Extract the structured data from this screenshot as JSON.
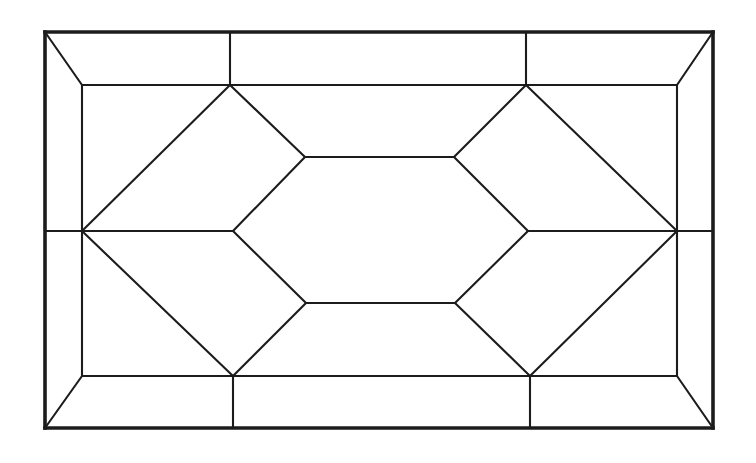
{
  "diagram": {
    "description": "nested-frame-line-drawing",
    "canvas": {
      "width": 756,
      "height": 463,
      "background_color": "#ffffff"
    },
    "style": {
      "line_color": "#1c1c1c",
      "outer_stroke_width": 3.6,
      "inner_stroke_width": 2.1
    },
    "vertices": {
      "outer_top_left": [
        45,
        32
      ],
      "outer_top_right": [
        713,
        32
      ],
      "outer_bottom_right": [
        713,
        428
      ],
      "outer_bottom_left": [
        45,
        428
      ],
      "outer_top_t1": [
        230,
        32
      ],
      "outer_top_t2": [
        526,
        32
      ],
      "outer_bottom_t1": [
        233,
        428
      ],
      "outer_bottom_t2": [
        530,
        428
      ],
      "outer_left_mid": [
        45,
        231
      ],
      "outer_right_mid": [
        713,
        231
      ],
      "inner_top_left": [
        82,
        85
      ],
      "inner_top_right": [
        677,
        85
      ],
      "inner_bottom_right": [
        677,
        376
      ],
      "inner_bottom_left": [
        82,
        376
      ],
      "inner_top_t1": [
        230,
        85
      ],
      "inner_top_t2": [
        526,
        85
      ],
      "inner_bottom_t1": [
        233,
        376
      ],
      "inner_bottom_t2": [
        530,
        376
      ],
      "inner_left_mid": [
        82,
        231
      ],
      "inner_right_mid": [
        677,
        231
      ],
      "hex_left": [
        233,
        231
      ],
      "hex_top_left": [
        305,
        157
      ],
      "hex_top_right": [
        454,
        157
      ],
      "hex_right": [
        528,
        231
      ],
      "hex_bottom_right": [
        455,
        303
      ],
      "hex_bottom_left": [
        306,
        303
      ]
    },
    "edges": {
      "outer": [
        [
          "outer_top_left",
          "outer_top_right"
        ],
        [
          "outer_top_right",
          "outer_bottom_right"
        ],
        [
          "outer_bottom_right",
          "outer_bottom_left"
        ],
        [
          "outer_bottom_left",
          "outer_top_left"
        ]
      ],
      "inner": [
        [
          "inner_top_left",
          "inner_top_right"
        ],
        [
          "inner_top_right",
          "inner_bottom_right"
        ],
        [
          "inner_bottom_right",
          "inner_bottom_left"
        ],
        [
          "inner_bottom_left",
          "inner_top_left"
        ],
        [
          "outer_top_left",
          "inner_top_left"
        ],
        [
          "outer_top_right",
          "inner_top_right"
        ],
        [
          "outer_bottom_right",
          "inner_bottom_right"
        ],
        [
          "outer_bottom_left",
          "inner_bottom_left"
        ],
        [
          "outer_top_t1",
          "inner_top_t1"
        ],
        [
          "outer_top_t2",
          "inner_top_t2"
        ],
        [
          "outer_bottom_t1",
          "inner_bottom_t1"
        ],
        [
          "outer_bottom_t2",
          "inner_bottom_t2"
        ],
        [
          "outer_left_mid",
          "inner_left_mid"
        ],
        [
          "outer_right_mid",
          "inner_right_mid"
        ],
        [
          "inner_top_t1",
          "inner_left_mid"
        ],
        [
          "inner_top_t2",
          "inner_right_mid"
        ],
        [
          "inner_bottom_t1",
          "inner_left_mid"
        ],
        [
          "inner_bottom_t2",
          "inner_right_mid"
        ],
        [
          "inner_top_t1",
          "hex_top_left"
        ],
        [
          "inner_top_t2",
          "hex_top_right"
        ],
        [
          "inner_bottom_t1",
          "hex_bottom_left"
        ],
        [
          "inner_bottom_t2",
          "hex_bottom_right"
        ],
        [
          "inner_left_mid",
          "hex_left"
        ],
        [
          "inner_right_mid",
          "hex_right"
        ],
        [
          "hex_left",
          "hex_top_left"
        ],
        [
          "hex_top_left",
          "hex_top_right"
        ],
        [
          "hex_top_right",
          "hex_right"
        ],
        [
          "hex_right",
          "hex_bottom_right"
        ],
        [
          "hex_bottom_right",
          "hex_bottom_left"
        ],
        [
          "hex_bottom_left",
          "hex_left"
        ]
      ]
    }
  }
}
